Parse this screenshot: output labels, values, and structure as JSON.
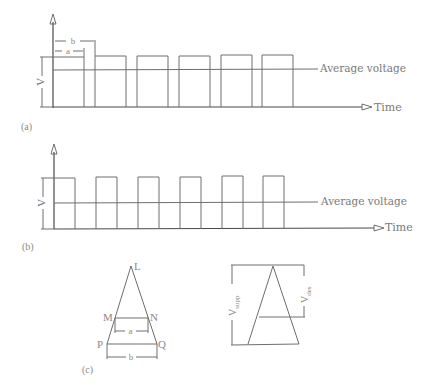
{
  "panels": {
    "a": {
      "caption": "(a)",
      "y_label": "V",
      "avg_label": "Average voltage",
      "time_label": "Time",
      "dim_a": "a",
      "dim_b": "b",
      "pulses": [
        [
          53,
          84
        ],
        [
          95,
          126
        ],
        [
          137,
          168
        ],
        [
          179,
          210
        ],
        [
          221,
          252
        ],
        [
          263,
          294
        ]
      ]
    },
    "b": {
      "caption": "(b)",
      "y_label": "V",
      "avg_label": "Average voltage",
      "time_label": "Time",
      "pulses": [
        [
          54,
          75
        ],
        [
          96,
          117
        ],
        [
          138,
          159
        ],
        [
          180,
          201
        ],
        [
          222,
          243
        ],
        [
          264,
          285
        ]
      ]
    },
    "c": {
      "caption": "(c)",
      "points": {
        "L": "L",
        "M": "M",
        "N": "N",
        "P": "P",
        "Q": "Q"
      },
      "dim_a": "a",
      "dim_b": "b",
      "v_supp": "V",
      "v_supp_sub": "supp",
      "v_des": "V",
      "v_des_sub": "des"
    }
  },
  "colors": {
    "line": "#6e6e6e",
    "text": "#7a7a7a",
    "background": "#ffffff"
  }
}
